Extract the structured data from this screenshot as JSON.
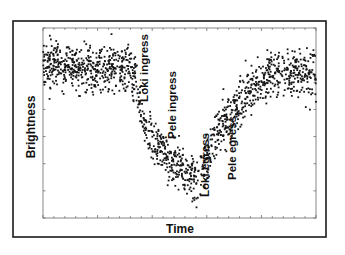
{
  "chart_data": {
    "type": "scatter",
    "title": "",
    "xlabel": "Time",
    "ylabel": "Brightness",
    "x_tick_labels": [],
    "y_tick_labels": [],
    "grid": false,
    "legend": null,
    "xlim": [
      0,
      100
    ],
    "ylim": [
      0,
      100
    ],
    "trend": {
      "x": [
        0,
        10,
        20,
        30,
        31,
        34,
        37,
        40,
        45,
        50,
        55,
        57,
        60,
        62,
        66,
        70,
        74,
        78,
        85,
        92,
        100
      ],
      "y": [
        80,
        80,
        78,
        80,
        79,
        72,
        50,
        42,
        33,
        26,
        20,
        19,
        28,
        42,
        48,
        56,
        64,
        72,
        75,
        78,
        76
      ]
    },
    "scatter_spread": 6,
    "annotations": [
      {
        "text": "Loki ingress",
        "x": 36.5,
        "y": 80,
        "rotation": -90
      },
      {
        "text": "Pele ingress",
        "x": 46.8,
        "y": 62,
        "rotation": -90
      },
      {
        "text": "Loki egress",
        "x": 59.2,
        "y": 28,
        "rotation": -90
      },
      {
        "text": "Pele egress",
        "x": 69.3,
        "y": 38,
        "rotation": -90
      }
    ]
  },
  "labels": {
    "xlabel": "Time",
    "ylabel": "Brightness",
    "annot_loki_ingress": "Loki ingress",
    "annot_pele_ingress": "Pele ingress",
    "annot_loki_egress": "Loki egress",
    "annot_pele_egress": "Pele egress"
  },
  "colors": {
    "points": "#161616",
    "frame": "#1a1a1a",
    "axis": "#6a6a6a",
    "background": "#ffffff"
  }
}
